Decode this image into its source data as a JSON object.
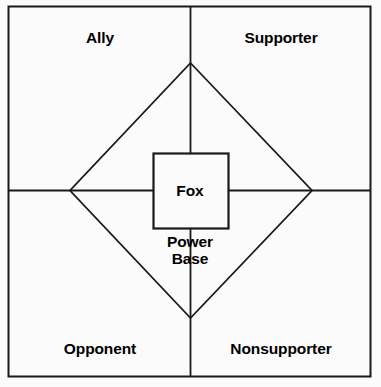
{
  "diagram": {
    "title_present": false,
    "background_color": "#fbfbfb",
    "line_color": "#1a1a1a",
    "text_color": "#000000",
    "quadrants": [
      {
        "key": "top-left",
        "label": "Ally"
      },
      {
        "key": "top-right",
        "label": "Supporter"
      },
      {
        "key": "bottom-left",
        "label": "Opponent"
      },
      {
        "key": "bottom-right",
        "label": "Nonsupporter"
      }
    ],
    "center_box": {
      "label": "Fox"
    },
    "center_caption": {
      "line1": "Power",
      "line2": "Base"
    }
  }
}
